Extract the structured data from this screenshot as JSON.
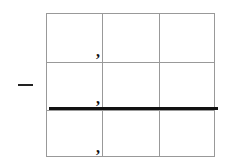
{
  "diagram": {
    "rows": 3,
    "cols": 3,
    "left_mark": "—",
    "commas": [
      ",",
      ",",
      ","
    ],
    "colors": {
      "grid": "#999999",
      "thick_line": "#111111",
      "text": "#111111"
    }
  }
}
